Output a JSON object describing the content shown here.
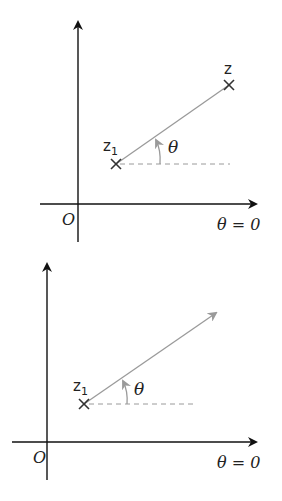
{
  "diagrams": [
    {
      "name": "top",
      "origin_label": "O",
      "axis_label": "θ = 0",
      "point_start_label": "z",
      "point_start_subscript": "1",
      "point_end_label": "z",
      "angle_label": "θ",
      "ray_type": "segment"
    },
    {
      "name": "bottom",
      "origin_label": "O",
      "axis_label": "θ = 0",
      "point_start_label": "z",
      "point_start_subscript": "1",
      "angle_label": "θ",
      "ray_type": "half-line"
    }
  ],
  "colors": {
    "axis": "#111111",
    "ray": "#9a9a9a",
    "dashed": "#9a9a9a",
    "cross": "#333333"
  }
}
